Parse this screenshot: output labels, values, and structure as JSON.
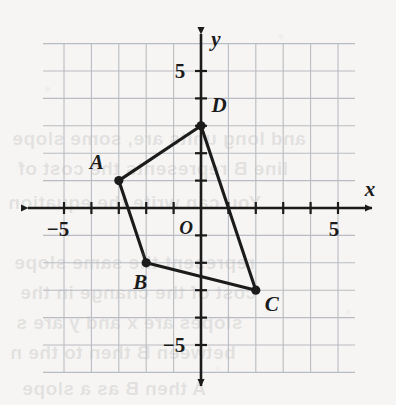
{
  "figure": {
    "kind": "coordinate-plane-polygon",
    "background_color": "#f6f5f3",
    "grid_color": "#b9bcc2",
    "axis_color": "#1b1b1b",
    "shape_color": "#1b1b1b"
  },
  "axes": {
    "x_label": "x",
    "y_label": "y",
    "origin_label": "O",
    "x_tick_labels": [
      {
        "text": "−5",
        "value": -5
      },
      {
        "text": "5",
        "value": 5
      }
    ],
    "y_tick_labels": [
      {
        "text": "5",
        "value": 5
      },
      {
        "text": "−5",
        "value": -5
      }
    ],
    "x_range": [
      -6,
      6
    ],
    "y_range": [
      -6,
      6
    ],
    "tick_step": 1,
    "grid": true
  },
  "chart_data": {
    "type": "scatter",
    "title": "",
    "xlabel": "x",
    "ylabel": "y",
    "xlim": [
      -6,
      6
    ],
    "ylim": [
      -6,
      6
    ],
    "grid": true,
    "legend": "none",
    "points": [
      {
        "label": "A",
        "x": -3,
        "y": 1,
        "label_dx": -22,
        "label_dy": -12
      },
      {
        "label": "B",
        "x": -2,
        "y": -2,
        "label_dx": -6,
        "label_dy": 26
      },
      {
        "label": "C",
        "x": 2,
        "y": -3,
        "label_dx": 16,
        "label_dy": 21
      },
      {
        "label": "D",
        "x": 0,
        "y": 3,
        "label_dx": 18,
        "label_dy": -14
      }
    ],
    "polygon_order": [
      "A",
      "B",
      "C",
      "D"
    ],
    "closed": true
  },
  "bleed_text": [
    {
      "text": "and long units are, some slope",
      "x": 12,
      "y": 128
    },
    {
      "text": "line B represents the cost of",
      "x": 18,
      "y": 158
    },
    {
      "text": "You can write the equation",
      "x": 8,
      "y": 192
    },
    {
      "text": "represent the same slope",
      "x": 14,
      "y": 252
    },
    {
      "text": "cost of the change in the",
      "x": 20,
      "y": 282
    },
    {
      "text": "slopes are x and y are s",
      "x": 16,
      "y": 312
    },
    {
      "text": "between B then to the n",
      "x": 10,
      "y": 342
    },
    {
      "text": "A then B as a slope",
      "x": 22,
      "y": 378
    }
  ]
}
